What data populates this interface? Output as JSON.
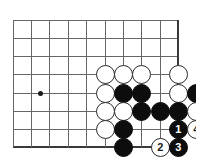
{
  "board": {
    "title": "Go board problem diagram",
    "geometry": {
      "cols": [
        13,
        31,
        49,
        68,
        86,
        105,
        123,
        141,
        160,
        178
      ],
      "rows": [
        20,
        38,
        56,
        74,
        93,
        111,
        129,
        147
      ],
      "edges": {
        "right_col_index": 9,
        "bottom_row_index": 7
      },
      "stone_diameter": 19
    },
    "star_points": [
      {
        "col": 1.55,
        "row": 4
      }
    ],
    "stones": [
      {
        "col": 5,
        "row": 3,
        "color": "white",
        "label": ""
      },
      {
        "col": 6,
        "row": 3,
        "color": "white",
        "label": ""
      },
      {
        "col": 7,
        "row": 3,
        "color": "white",
        "label": ""
      },
      {
        "col": 9,
        "row": 3,
        "color": "white",
        "label": ""
      },
      {
        "col": 5,
        "row": 4,
        "color": "white",
        "label": ""
      },
      {
        "col": 6,
        "row": 4,
        "color": "black",
        "label": ""
      },
      {
        "col": 7,
        "row": 4,
        "color": "black",
        "label": ""
      },
      {
        "col": 9,
        "row": 4,
        "color": "white",
        "label": ""
      },
      {
        "col": 10,
        "row": 4,
        "color": "black",
        "label": ""
      },
      {
        "col": 5,
        "row": 5,
        "color": "white",
        "label": ""
      },
      {
        "col": 6,
        "row": 5,
        "color": "white",
        "label": ""
      },
      {
        "col": 7,
        "row": 5,
        "color": "black",
        "label": ""
      },
      {
        "col": 8,
        "row": 5,
        "color": "black",
        "label": ""
      },
      {
        "col": 9,
        "row": 5,
        "color": "black",
        "label": ""
      },
      {
        "col": 10,
        "row": 5,
        "color": "white",
        "label": ""
      },
      {
        "col": 5,
        "row": 6,
        "color": "white",
        "label": ""
      },
      {
        "col": 6,
        "row": 6,
        "color": "black",
        "label": ""
      },
      {
        "col": 9,
        "row": 6,
        "color": "black",
        "label": "1"
      },
      {
        "col": 10,
        "row": 6,
        "color": "white",
        "label": "4"
      },
      {
        "col": 6,
        "row": 7,
        "color": "black",
        "label": ""
      },
      {
        "col": 8,
        "row": 7,
        "color": "white",
        "label": "2"
      },
      {
        "col": 9,
        "row": 7,
        "color": "black",
        "label": "3"
      }
    ],
    "move_labels": [
      "1",
      "2",
      "3",
      "4"
    ],
    "colors": {
      "grid": "#666666",
      "edge": "#3a3a3a",
      "black_stone": "#0d0d0d",
      "white_stone": "#ffffff",
      "white_stone_border": "#2b2b2b",
      "background": "#ffffff"
    }
  }
}
